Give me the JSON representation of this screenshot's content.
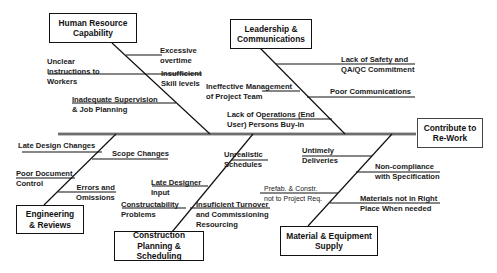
{
  "effect": {
    "label_line1": "Contribute to",
    "label_line2": "Re-Work"
  },
  "categories": {
    "human_resource": {
      "title_line1": "Human Resource",
      "title_line2": "Capability",
      "causes": [
        {
          "line1": "Excessive",
          "line2": "overtime"
        },
        {
          "line1": "Unclear",
          "line2": "Instructions to",
          "line3": "Workers"
        },
        {
          "line1": "Insufficient",
          "line2": "Skill levels"
        },
        {
          "line1": "Inadequate Supervision",
          "line2": "& Job Planning"
        }
      ]
    },
    "leadership": {
      "title_line1": "Leadership &",
      "title_line2": "Communications",
      "causes": [
        {
          "line1": "Lack of Safety and",
          "line2": "QA/QC Commitment"
        },
        {
          "line1": "Ineffective Management",
          "line2": "of Project Team"
        },
        {
          "line1": "Poor Communications"
        },
        {
          "line1": "Lack of Operations (End",
          "line2": "User) Persons Buy-in"
        }
      ]
    },
    "engineering": {
      "title_line1": "Engineering",
      "title_line2": "& Reviews",
      "causes": [
        {
          "line1": "Late Design Changes"
        },
        {
          "line1": "Scope Changes"
        },
        {
          "line1": "Poor Document",
          "line2": "Control"
        },
        {
          "line1": "Errors and",
          "line2": "Omissions"
        }
      ]
    },
    "construction": {
      "title_line1": "Construction",
      "title_line2": "Planning & Scheduling",
      "causes": [
        {
          "line1": "Unrealistic",
          "line2": "Schedules"
        },
        {
          "line1": "Late Designer",
          "line2": "Input"
        },
        {
          "line1": "Constructability",
          "line2": "Problems"
        },
        {
          "line1": "Insuficient Turnover",
          "line2": "and Commissioning",
          "line3": "Resourcing"
        }
      ]
    },
    "material": {
      "title_line1": "Material & Equipment",
      "title_line2": "Supply",
      "causes": [
        {
          "line1": "Untimely",
          "line2": "Deliveries"
        },
        {
          "line1": "Non-compliance",
          "line2": "with Specification"
        },
        {
          "line1": "Prefab. & Constr.",
          "line2": "not to Project Req."
        },
        {
          "line1": "Materials not in Right",
          "line2": "Place When needed"
        }
      ]
    }
  }
}
